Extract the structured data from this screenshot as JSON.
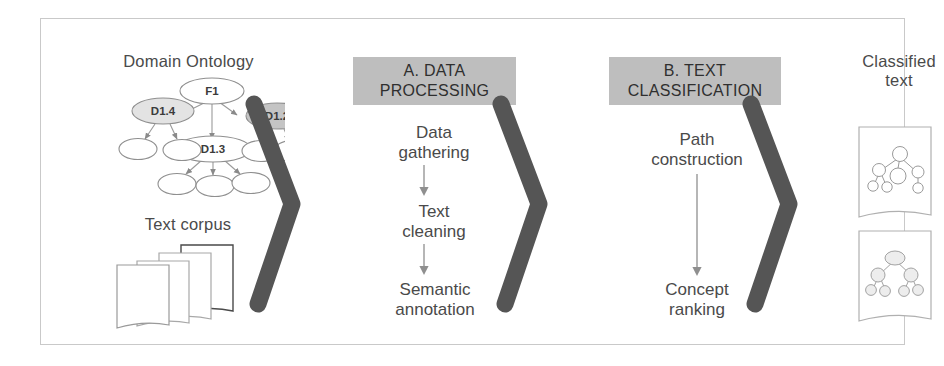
{
  "diagram": {
    "title_visible": false,
    "frame_border_color": "#c9c9c9",
    "chevron_color": "#555555",
    "band_color": "#bebebe",
    "stages": [
      {
        "id": "inputs",
        "labels": {
          "ontology": "Domain Ontology",
          "corpus": "Text corpus"
        },
        "ontology_nodes": [
          {
            "id": "F1",
            "label": "F1",
            "fill": "#ffffff"
          },
          {
            "id": "D1.4",
            "label": "D1.4",
            "fill": "#e3e3e3"
          },
          {
            "id": "D1.2",
            "label": "D1.2",
            "fill": "#c4c4c4"
          },
          {
            "id": "D1.3",
            "label": "D1.3",
            "fill": "#ffffff"
          }
        ],
        "ontology_leaf_count": 7,
        "corpus_document_count": 4
      },
      {
        "id": "stage-a",
        "band_label": "A. DATA\nPROCESSING",
        "band_line1": "A. DATA",
        "band_line2": "PROCESSING",
        "steps": [
          {
            "line1": "Data",
            "line2": "gathering"
          },
          {
            "line1": "Text",
            "line2": "cleaning"
          },
          {
            "line1": "Semantic",
            "line2": "annotation"
          }
        ]
      },
      {
        "id": "stage-b",
        "band_line1": "B. TEXT",
        "band_line2": "CLASSIFICATION",
        "steps": [
          {
            "line1": "Path",
            "line2": "construction"
          },
          {
            "line1": "Concept",
            "line2": "ranking"
          }
        ]
      },
      {
        "id": "output",
        "label_line1": "Classified",
        "label_line2": "text",
        "document_count": 2
      }
    ]
  },
  "labels": {
    "ontology": "Domain Ontology",
    "corpus": "Text corpus",
    "band_a_l1": "A. DATA",
    "band_a_l2": "PROCESSING",
    "band_b_l1": "B. TEXT",
    "band_b_l2": "CLASSIFICATION",
    "a_step1_l1": "Data",
    "a_step1_l2": "gathering",
    "a_step2_l1": "Text",
    "a_step2_l2": "cleaning",
    "a_step3_l1": "Semantic",
    "a_step3_l2": "annotation",
    "b_step1_l1": "Path",
    "b_step1_l2": "construction",
    "b_step2_l1": "Concept",
    "b_step2_l2": "ranking",
    "out_l1": "Classified",
    "out_l2": "text",
    "node_f1": "F1",
    "node_d14": "D1.4",
    "node_d12": "D1.2",
    "node_d13": "D1.3"
  }
}
